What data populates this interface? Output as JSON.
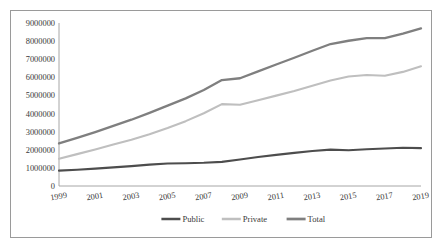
{
  "chart_data": {
    "type": "line",
    "title": "",
    "xlabel": "",
    "ylabel": "",
    "grid": false,
    "legend_position": "bottom",
    "xlim": [
      1999,
      2019
    ],
    "ylim": [
      0,
      9000000
    ],
    "ytick_step": 1000000,
    "x": [
      1999,
      2000,
      2001,
      2002,
      2003,
      2004,
      2005,
      2006,
      2007,
      2008,
      2009,
      2010,
      2011,
      2012,
      2013,
      2014,
      2015,
      2016,
      2017,
      2018,
      2019
    ],
    "xtick_labels": [
      "1999",
      "2001",
      "2003",
      "2005",
      "2007",
      "2009",
      "2011",
      "2013",
      "2015",
      "2017",
      "2019"
    ],
    "ytick_labels": [
      "0",
      "1000000",
      "2000000",
      "3000000",
      "4000000",
      "5000000",
      "6000000",
      "7000000",
      "8000000",
      "9000000"
    ],
    "series": [
      {
        "name": "Public",
        "color": "#4d4d4d",
        "width": 2.1,
        "values": [
          850000,
          900000,
          960000,
          1030000,
          1100000,
          1180000,
          1240000,
          1260000,
          1280000,
          1330000,
          1460000,
          1600000,
          1720000,
          1830000,
          1930000,
          2010000,
          1970000,
          2030000,
          2070000,
          2110000,
          2090000
        ]
      },
      {
        "name": "Private",
        "color": "#bfbfbf",
        "width": 2.1,
        "values": [
          1500000,
          1760000,
          2020000,
          2290000,
          2560000,
          2860000,
          3200000,
          3580000,
          4020000,
          4520000,
          4490000,
          4730000,
          4990000,
          5250000,
          5540000,
          5830000,
          6050000,
          6130000,
          6090000,
          6300000,
          6610000
        ]
      },
      {
        "name": "Total",
        "color": "#7f7f7f",
        "width": 2.3,
        "values": [
          2350000,
          2660000,
          2980000,
          3320000,
          3660000,
          4040000,
          4440000,
          4840000,
          5300000,
          5850000,
          5950000,
          6330000,
          6710000,
          7080000,
          7470000,
          7840000,
          8020000,
          8160000,
          8160000,
          8410000,
          8700000
        ]
      }
    ]
  },
  "legend": {
    "items": [
      {
        "label": "Public"
      },
      {
        "label": "Private"
      },
      {
        "label": "Total"
      }
    ]
  },
  "axes": {
    "axis_color": "#a6a6a6"
  }
}
